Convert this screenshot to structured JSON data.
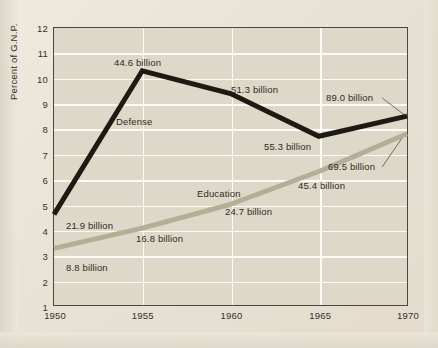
{
  "chart_data": {
    "type": "line",
    "title": "",
    "xlabel": "",
    "ylabel": "Percent of G.N.P.",
    "xlim": [
      1950,
      1970
    ],
    "ylim": [
      1,
      12
    ],
    "grid": true,
    "legend_position": "inline-labels",
    "x": [
      1950,
      1955,
      1960,
      1965,
      1970
    ],
    "xticklabels": [
      "1950",
      "1955",
      "1960",
      "1965",
      "1970"
    ],
    "yticklabels": [
      "1",
      "2",
      "3",
      "4",
      "5",
      "6",
      "7",
      "8",
      "9",
      "10",
      "11",
      "12"
    ],
    "yticks": [
      1,
      2,
      3,
      4,
      5,
      6,
      7,
      8,
      9,
      10,
      11,
      12
    ],
    "series": [
      {
        "name": "Defense",
        "color": "#1d1a13",
        "values": [
          4.6,
          10.3,
          9.4,
          7.7,
          8.5
        ],
        "point_labels": [
          "21.9 billion",
          "44.6 billion",
          "51.3 billion",
          "55.3 billion",
          "89.0 billion"
        ]
      },
      {
        "name": "Education",
        "color": "#b5ae96",
        "values": [
          3.25,
          4.05,
          5.0,
          6.3,
          7.8
        ],
        "point_labels": [
          "8.8 billion",
          "16.8 billion",
          "24.7 billion",
          "45.4 billion",
          "69.5 billion"
        ]
      }
    ],
    "annotations": [
      {
        "id": "defense-series-label",
        "text": "Defense",
        "x_px": 62,
        "y_px": 88
      },
      {
        "id": "education-series-label",
        "text": "Education",
        "x_px": 143,
        "y_px": 160
      },
      {
        "id": "defense-1950-label",
        "text": "21.9 billion",
        "x_px": 12,
        "y_px": 192
      },
      {
        "id": "defense-1955-label",
        "text": "44.6 billion",
        "x_px": 60,
        "y_px": 29
      },
      {
        "id": "defense-1960-label",
        "text": "51.3 billion",
        "x_px": 177,
        "y_px": 56
      },
      {
        "id": "defense-1965-label",
        "text": "55.3 billion",
        "x_px": 210,
        "y_px": 113
      },
      {
        "id": "defense-1970-label",
        "text": "89.0 billion",
        "x_px": 272,
        "y_px": 64
      },
      {
        "id": "education-1950-label",
        "text": "8.8 billion",
        "x_px": 12,
        "y_px": 234
      },
      {
        "id": "education-1955-label",
        "text": "16.8 billion",
        "x_px": 82,
        "y_px": 205
      },
      {
        "id": "education-1960-label",
        "text": "24.7 billion",
        "x_px": 171,
        "y_px": 178
      },
      {
        "id": "education-1965-label",
        "text": "45.4 billion",
        "x_px": 244,
        "y_px": 152
      },
      {
        "id": "education-1970-label",
        "text": "69.5 billion",
        "x_px": 274,
        "y_px": 133
      }
    ],
    "colors": {
      "background": "#ece7da",
      "plot_background": "#ddd8c8",
      "gridline": "#fbfaf4",
      "frame": "#4a473e",
      "defense_line": "#1d1a13",
      "education_line": "#b5ae96",
      "text": "#2e2b22"
    }
  }
}
